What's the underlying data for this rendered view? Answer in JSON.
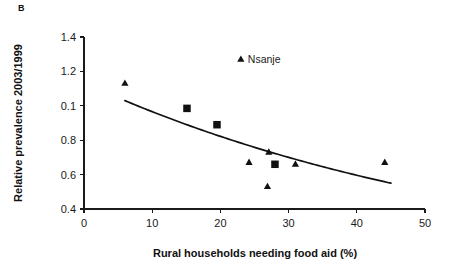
{
  "panel": {
    "label": "B"
  },
  "chart_data": {
    "type": "scatter",
    "title": "",
    "xlabel": "Rural households needing food aid (%)",
    "ylabel": "Relative prevalence 2003/1999",
    "xlim": [
      0,
      50
    ],
    "ylim": [
      0.4,
      1.4
    ],
    "xticks": [
      0,
      10,
      20,
      30,
      40,
      50
    ],
    "xticklabels": [
      "0",
      "10",
      "20",
      "30",
      "40",
      "50"
    ],
    "yticks": [
      0.4,
      0.6,
      0.8,
      1.0,
      1.2,
      1.4
    ],
    "yticklabels": [
      "0.4",
      "0.6",
      "0.8",
      "0.1",
      "1.2",
      "1.4"
    ],
    "grid": false,
    "legend": false,
    "series": [
      {
        "name": "triangles",
        "marker": "triangle",
        "color": "#111111",
        "points": [
          {
            "x": 6.0,
            "y": 1.13
          },
          {
            "x": 23.0,
            "y": 1.27,
            "label": "Nsanje"
          },
          {
            "x": 24.2,
            "y": 0.67
          },
          {
            "x": 27.1,
            "y": 0.73
          },
          {
            "x": 26.9,
            "y": 0.53
          },
          {
            "x": 31.0,
            "y": 0.66
          },
          {
            "x": 44.1,
            "y": 0.67
          }
        ]
      },
      {
        "name": "squares",
        "marker": "square",
        "color": "#111111",
        "points": [
          {
            "x": 15.1,
            "y": 0.985
          },
          {
            "x": 19.5,
            "y": 0.89
          },
          {
            "x": 28.0,
            "y": 0.66
          }
        ]
      }
    ],
    "trendline": {
      "type": "exponential-decay",
      "x_start": 6.0,
      "x_end": 45.0,
      "y_start": 1.03,
      "y_end": 0.55
    },
    "annotations": [
      {
        "text": "Nsanje",
        "x": 23.0,
        "y": 1.27
      }
    ]
  }
}
